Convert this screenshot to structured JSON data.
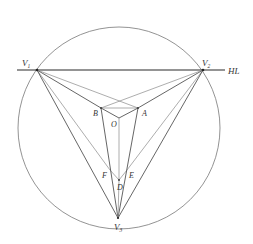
{
  "diagram": {
    "title": "",
    "colors": {
      "line": "#555555",
      "light_line": "#8a8a8a",
      "horizon": "#2a2a2a",
      "circle": "#777777",
      "text": "#333333"
    },
    "horizon_label": "HL",
    "labels": {
      "V1": {
        "main": "V",
        "sub": "1"
      },
      "V2": {
        "main": "V",
        "sub": "2"
      },
      "V3": {
        "main": "V",
        "sub": "3"
      },
      "A": "A",
      "B": "B",
      "O": "O",
      "D": "D",
      "E": "E",
      "F": "F"
    },
    "points": {
      "V1": [
        37,
        70
      ],
      "V2": [
        203,
        70
      ],
      "V3": [
        118,
        218
      ],
      "A": [
        138,
        108
      ],
      "B": [
        101,
        108
      ],
      "O": [
        119,
        118
      ],
      "D": [
        119,
        180
      ],
      "E": [
        127,
        170
      ],
      "F": [
        110,
        170
      ]
    },
    "circle": {
      "cx": 119,
      "cy": 128,
      "r": 101
    },
    "horizon_line": {
      "x1": 17,
      "x2": 225,
      "y": 70
    }
  }
}
